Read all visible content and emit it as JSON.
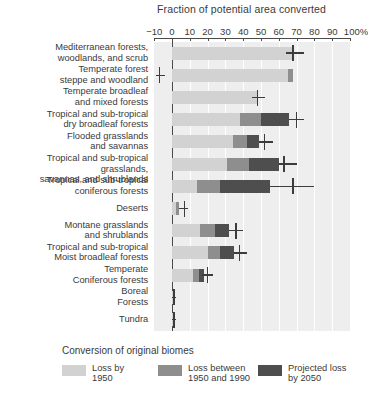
{
  "chart_data": {
    "type": "bar",
    "orientation": "horizontal",
    "stacked": true,
    "title": "Fraction of potential area converted",
    "xlabel": "",
    "ylabel": "",
    "xlim": [
      -10,
      100
    ],
    "xticks": [
      -10,
      0,
      10,
      20,
      30,
      40,
      50,
      60,
      70,
      80,
      90,
      100
    ],
    "xticklabels": [
      "−10",
      "0",
      "10",
      "20",
      "30",
      "40",
      "50",
      "60",
      "70",
      "80",
      "90",
      "100%"
    ],
    "grid": "vertical-white",
    "legend_position": "bottom",
    "legend_title": "Conversion of original biomes",
    "series": [
      {
        "name": "Loss by 1950",
        "color": "#d2d2d2",
        "values": [
          68,
          65,
          48,
          38,
          34,
          31,
          14,
          2,
          16,
          20,
          12,
          0.5,
          0.3
        ]
      },
      {
        "name": "Loss between 1950 and 1990",
        "color": "#8e8e8e",
        "values": [
          0,
          3,
          0,
          12,
          8,
          12,
          13,
          2,
          8,
          7,
          3,
          0.5,
          0.3
        ]
      },
      {
        "name": "Projected loss by 2050",
        "color": "#4e4e4e",
        "values": [
          0,
          0,
          0,
          16,
          7,
          17,
          28,
          0,
          8,
          8,
          3,
          0.5,
          0.5
        ]
      }
    ],
    "categories": [
      "Mediterranean forests, woodlands, and scrub",
      "Temperate forest steppe and woodland",
      "Temperate broadleaf and mixed forests",
      "Tropical and sub-tropical dry broadleaf forests",
      "Flooded grasslands and savannas",
      "Tropical and sub-tropical grasslands, savannas, and shrublands",
      "Tropical and sub-tropical coniferous forests",
      "Deserts",
      "Montane grasslands and shrublands",
      "Tropical and sub-tropical Moist broadleaf forests",
      "Temperate Coniferous forests",
      "Boreal Forests",
      "Tundra"
    ],
    "error_markers": [
      68,
      0,
      48,
      70,
      52,
      63,
      68,
      7,
      36,
      38,
      20,
      1,
      1
    ],
    "rows": [
      {
        "label": "Mediterranean forests,\nwoodlands, and scrub",
        "seg1": 68,
        "seg2": 0,
        "seg3": 0,
        "marker": 68,
        "marker_lo": 64,
        "marker_hi": 74
      },
      {
        "label": "Temperate forest\nsteppe and woodland",
        "seg1": 65,
        "seg2": 3,
        "seg3": 0,
        "marker": -7,
        "marker_lo": -9,
        "marker_hi": -4
      },
      {
        "label": "Temperate broadleaf\nand mixed forests",
        "seg1": 48,
        "seg2": 0,
        "seg3": 0,
        "marker": 48,
        "marker_lo": 45,
        "marker_hi": 52
      },
      {
        "label": "Tropical and sub-tropical\ndry broadleaf forests",
        "seg1": 38,
        "seg2": 12,
        "seg3": 16,
        "marker": 70,
        "marker_lo": 66,
        "marker_hi": 74
      },
      {
        "label": "Flooded grasslands\nand savannas",
        "seg1": 34,
        "seg2": 8,
        "seg3": 7,
        "marker": 52,
        "marker_lo": 49,
        "marker_hi": 57
      },
      {
        "label": "Tropical and sub-tropical grasslands,\nsavannas, and shrublands",
        "seg1": 31,
        "seg2": 12,
        "seg3": 17,
        "marker": 63,
        "marker_lo": 60,
        "marker_hi": 70
      },
      {
        "label": "Tropical and sub-tropical\nconiferous forests",
        "seg1": 14,
        "seg2": 13,
        "seg3": 28,
        "marker": 68,
        "marker_lo": 55,
        "marker_hi": 80
      },
      {
        "label": "Deserts",
        "seg1": 2,
        "seg2": 2,
        "seg3": 0,
        "marker": 7,
        "marker_lo": 4,
        "marker_hi": 9
      },
      {
        "label": "Montane grasslands\nand shrublands",
        "seg1": 16,
        "seg2": 8,
        "seg3": 8,
        "marker": 36,
        "marker_lo": 32,
        "marker_hi": 40
      },
      {
        "label": "Tropical and sub-tropical\nMoist broadleaf forests",
        "seg1": 20,
        "seg2": 7,
        "seg3": 8,
        "marker": 38,
        "marker_lo": 35,
        "marker_hi": 42
      },
      {
        "label": "Temperate\nConiferous forests",
        "seg1": 12,
        "seg2": 3,
        "seg3": 3,
        "marker": 20,
        "marker_lo": 17,
        "marker_hi": 23
      },
      {
        "label": "Boreal\nForests",
        "seg1": 0.6,
        "seg2": 0.6,
        "seg3": 0.6,
        "marker": 1,
        "marker_lo": 0,
        "marker_hi": 2
      },
      {
        "label": "Tundra",
        "seg1": 0.4,
        "seg2": 0.4,
        "seg3": 0.6,
        "marker": 1,
        "marker_lo": 0,
        "marker_hi": 2
      }
    ]
  },
  "legend": {
    "title": "Conversion of original biomes",
    "items": [
      {
        "label": "Loss by\n1950",
        "color": "#d2d2d2"
      },
      {
        "label": "Loss between\n1950 and 1990",
        "color": "#8e8e8e"
      },
      {
        "label": "Projected loss\nby 2050",
        "color": "#4e4e4e"
      }
    ]
  }
}
